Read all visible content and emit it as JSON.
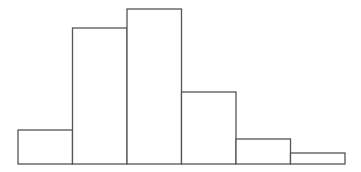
{
  "chart_data": {
    "type": "bar",
    "subtype": "histogram",
    "title": "",
    "xlabel": "",
    "ylabel": "",
    "categories": [
      "bin1",
      "bin2",
      "bin3",
      "bin4",
      "bin5",
      "bin6"
    ],
    "values": [
      34,
      136,
      155,
      72,
      25,
      11
    ],
    "ylim": [
      0,
      155
    ],
    "grid": false,
    "legend": null,
    "axes_visible": false,
    "style": {
      "bar_fill": "#ffffff",
      "bar_stroke": "#555555",
      "stroke_width": 1.3
    },
    "layout": {
      "x_start": 18,
      "x_end": 345,
      "baseline_y": 164,
      "max_bar_px": 155
    }
  }
}
